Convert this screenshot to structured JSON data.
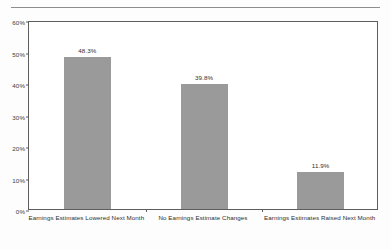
{
  "chart_data": {
    "type": "bar",
    "title": "",
    "xlabel": "",
    "ylabel": "",
    "categories": [
      "Earnings Estimates Lowered Next Month",
      "No Earnings Estimate Changes",
      "Earnings Estimates Raised Next Month"
    ],
    "values": [
      48.3,
      39.8,
      11.9
    ],
    "value_labels": [
      "48.3%",
      "39.8%",
      "11.9%"
    ],
    "ylim": [
      0,
      60
    ],
    "ytick_values": [
      60,
      50,
      40,
      30,
      20,
      10,
      0
    ],
    "ytick_labels": [
      "60%",
      "50%",
      "40%",
      "30%",
      "20%",
      "10%",
      "0%"
    ],
    "grid": false,
    "legend": null,
    "bar_color": "#9a9a9a",
    "frame_color": "#5d5d5d",
    "background_color": "#ffffff"
  }
}
